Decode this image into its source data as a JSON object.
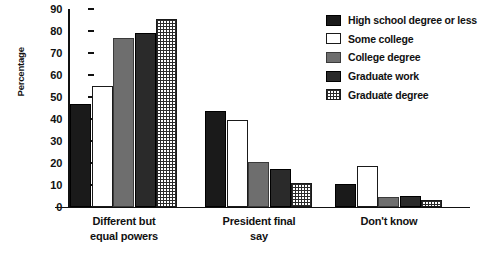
{
  "chart_data": {
    "type": "bar",
    "title": "",
    "xlabel": "",
    "ylabel": "Percentage",
    "ylim": [
      0,
      90
    ],
    "yticks": [
      0,
      10,
      20,
      30,
      40,
      50,
      60,
      70,
      80,
      90
    ],
    "grid": false,
    "legend_position": "top-right",
    "categories": [
      "Different but\nequal powers",
      "President final\nsay",
      "Don't know"
    ],
    "series": [
      {
        "name": "High school degree or less",
        "pattern": "solid-black",
        "color": "#1a1a1a",
        "values": [
          47,
          43.5,
          10.5
        ]
      },
      {
        "name": "Some college",
        "pattern": "white-outline",
        "color": "#ffffff",
        "values": [
          55,
          39.5,
          18.5
        ]
      },
      {
        "name": "College degree",
        "pattern": "solid-gray",
        "color": "#6e6e6e",
        "values": [
          77,
          20.5,
          4.5
        ]
      },
      {
        "name": "Graduate work",
        "pattern": "solid-dark",
        "color": "#2a2a2a",
        "values": [
          79,
          17.5,
          5
        ]
      },
      {
        "name": "Graduate degree",
        "pattern": "crosshatch",
        "color": "#2b2b2b",
        "values": [
          85.5,
          11,
          3
        ]
      }
    ]
  },
  "axis": {
    "y_label": "Percentage",
    "y_ticks": [
      "90",
      "80",
      "70",
      "60",
      "50",
      "40",
      "30",
      "20",
      "10",
      "0"
    ]
  },
  "legend": {
    "items": [
      {
        "label": "High school degree or less"
      },
      {
        "label": "Some college"
      },
      {
        "label": "College degree"
      },
      {
        "label": "Graduate work"
      },
      {
        "label": "Graduate degree"
      }
    ]
  },
  "categories": [
    {
      "label": "Different but\nequal powers"
    },
    {
      "label": "President final\nsay"
    },
    {
      "label": "Don't know"
    }
  ]
}
